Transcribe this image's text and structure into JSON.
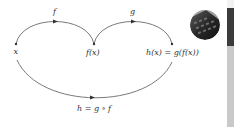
{
  "diagram": {
    "nodes": [
      {
        "id": "x",
        "label": "x"
      },
      {
        "id": "fx",
        "label": "f(x)"
      },
      {
        "id": "hx",
        "label": "h(x) = g(f(x))"
      }
    ],
    "edges": [
      {
        "from": "x",
        "to": "fx",
        "label": "f"
      },
      {
        "from": "fx",
        "to": "hx",
        "label": "g"
      },
      {
        "from": "x",
        "to": "hx",
        "label": "h = g ∘ f"
      }
    ]
  },
  "thumbnail": {
    "icon": "keyboard-photo-icon"
  },
  "colors": {
    "line": "#6a6a6a",
    "text": "#333333",
    "sidebar_dark": "#3c3c3c",
    "sidebar_light": "#c9c9c9"
  }
}
